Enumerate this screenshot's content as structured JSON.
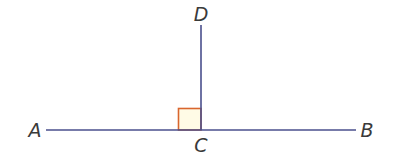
{
  "diagram": {
    "colors": {
      "line": "#4a4f8c",
      "right_angle_stroke": "#d9662e",
      "right_angle_fill": "#fffbe6",
      "label": "#3a3a3a"
    },
    "points": {
      "A": {
        "label": "A"
      },
      "B": {
        "label": "B"
      },
      "C": {
        "label": "C"
      },
      "D": {
        "label": "D"
      }
    },
    "segments": [
      {
        "from": "A",
        "to": "B"
      },
      {
        "from": "C",
        "to": "D"
      }
    ],
    "right_angle_at": "C"
  }
}
